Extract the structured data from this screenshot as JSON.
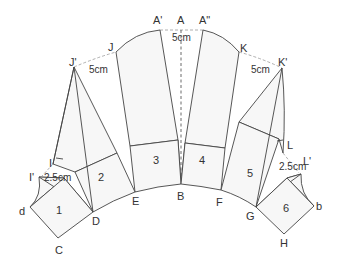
{
  "figure": {
    "colors": {
      "line": "#444444",
      "fill": "#f7f7f7",
      "guide": "#9a9a9a",
      "text": "#333333"
    }
  },
  "points": {
    "A_prime": "A'",
    "A": "A",
    "A_double": "A\"",
    "J": "J",
    "K": "K",
    "J_prime": "J'",
    "K_prime": "K'",
    "I": "I",
    "L": "L",
    "I_prime": "I'",
    "L_prime": "L'",
    "d": "d",
    "b": "b",
    "C": "C",
    "D": "D",
    "E": "E",
    "B": "B",
    "F": "F",
    "G": "G",
    "H": "H"
  },
  "panels": [
    "1",
    "2",
    "3",
    "4",
    "5",
    "6"
  ],
  "dimensions": {
    "center_gap": "5cm",
    "left_gap": "5cm",
    "right_gap": "5cm",
    "left_small": "2.5cm",
    "right_small": "2.5cm"
  }
}
